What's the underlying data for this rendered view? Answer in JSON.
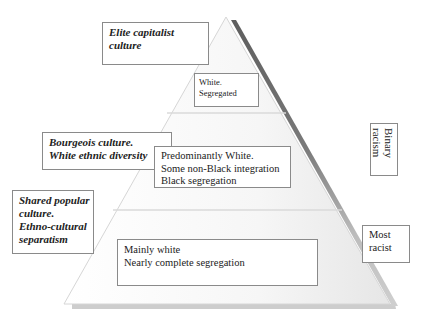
{
  "diagram": {
    "type": "pyramid",
    "levels": [
      {
        "name": "top",
        "description": [
          "White.",
          "Segregated"
        ]
      },
      {
        "name": "middle",
        "description": [
          "Predominantly White.",
          "Some non-Black integration",
          "Black  segregation"
        ]
      },
      {
        "name": "bottom",
        "description": [
          "Mainly white",
          "Nearly complete segregation"
        ]
      }
    ],
    "left_labels": [
      {
        "lines": [
          "Elite  capitalist",
          " culture"
        ]
      },
      {
        "lines": [
          "Bourgeois culture.",
          "White ethnic diversity"
        ]
      },
      {
        "lines": [
          "Shared popular",
          "culture.",
          "Ethno-cultural",
          "separatism"
        ]
      }
    ],
    "right_labels": [
      {
        "text": "Binary racism",
        "lines": [
          "Binary",
          "racism"
        ]
      },
      {
        "lines": [
          "Most",
          "racist"
        ]
      }
    ]
  },
  "colors": {
    "edge_dark": "#6e6e6e",
    "edge_light": "#bdbdbd",
    "fill_top": "#ffffff",
    "fill_bottom": "#f0f0f0",
    "box_border": "#8a8a8a"
  }
}
